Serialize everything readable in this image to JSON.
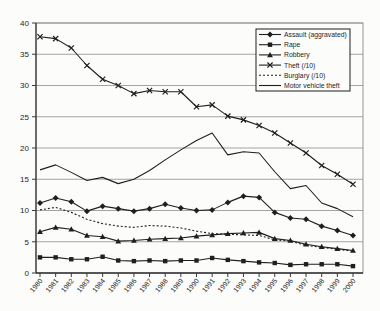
{
  "chart_data": {
    "type": "line",
    "title": "",
    "xlabel": "",
    "ylabel": "",
    "ylim": [
      0,
      40
    ],
    "yticks": [
      0,
      5,
      10,
      15,
      20,
      25,
      30,
      35,
      40
    ],
    "grid": true,
    "legend_position": "top-right",
    "x": [
      1980,
      1981,
      1982,
      1983,
      1984,
      1985,
      1986,
      1987,
      1988,
      1989,
      1990,
      1991,
      1992,
      1993,
      1994,
      1995,
      1996,
      1997,
      1998,
      1999,
      2000
    ],
    "series": [
      {
        "name": "Assault (aggravated)",
        "marker": "diamond",
        "line_style": "solid",
        "values": [
          11.2,
          12.0,
          11.4,
          9.9,
          10.7,
          10.3,
          9.9,
          10.3,
          11.0,
          10.4,
          10.0,
          10.1,
          11.3,
          12.3,
          12.1,
          9.7,
          8.8,
          8.6,
          7.5,
          6.8,
          6.0
        ]
      },
      {
        "name": "Rape",
        "marker": "square",
        "line_style": "solid",
        "values": [
          2.5,
          2.5,
          2.2,
          2.2,
          2.6,
          2.0,
          1.9,
          2.0,
          1.9,
          2.0,
          2.0,
          2.4,
          2.1,
          1.9,
          1.7,
          1.6,
          1.3,
          1.4,
          1.4,
          1.4,
          1.1
        ]
      },
      {
        "name": "Robbery",
        "marker": "triangle",
        "line_style": "solid",
        "values": [
          6.6,
          7.3,
          7.0,
          6.0,
          5.8,
          5.1,
          5.2,
          5.4,
          5.5,
          5.6,
          5.9,
          6.1,
          6.3,
          6.4,
          6.5,
          5.5,
          5.2,
          4.6,
          4.2,
          3.9,
          3.6
        ]
      },
      {
        "name": "Theft (/10)",
        "marker": "x",
        "line_style": "solid",
        "values": [
          37.8,
          37.5,
          36.0,
          33.2,
          31.0,
          30.0,
          28.7,
          29.2,
          29.0,
          29.0,
          26.6,
          26.9,
          25.1,
          24.5,
          23.6,
          22.4,
          20.8,
          19.2,
          17.2,
          15.8,
          14.2
        ]
      },
      {
        "name": "Burglary (/10)",
        "marker": "none",
        "line_style": "dotted",
        "values": [
          10.1,
          10.5,
          9.7,
          8.6,
          7.9,
          7.5,
          7.3,
          7.6,
          7.5,
          7.2,
          6.7,
          6.3,
          6.2,
          6.1,
          6.0,
          5.3,
          5.1,
          4.4,
          4.1,
          3.8,
          3.5
        ]
      },
      {
        "name": "Motor vehicle theft",
        "marker": "none",
        "line_style": "solid",
        "values": [
          16.5,
          17.3,
          16.1,
          14.8,
          15.3,
          14.3,
          15.0,
          16.4,
          18.1,
          19.7,
          21.2,
          22.4,
          18.9,
          19.4,
          19.2,
          16.2,
          13.5,
          14.0,
          11.2,
          10.3,
          9.0
        ]
      }
    ],
    "colors": {
      "ink": "#1f1f1f",
      "grid": "#8d8d8d",
      "axis": "#3a3a3a",
      "paper": "#fcfcfa",
      "legend_fill": "#fcfcfa"
    }
  }
}
